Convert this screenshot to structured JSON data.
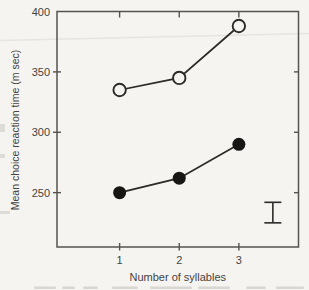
{
  "figure": {
    "paper_color": "#f5f4f1",
    "frame_color": "#55534f",
    "data_color": "#2c2a28",
    "marker_fill": "#171614",
    "text_color": "#454340"
  },
  "chart_data": {
    "type": "line",
    "title": "",
    "xlabel": "Number of syllables",
    "ylabel": "Mean choice reaction time (m sec)",
    "x": [
      1,
      2,
      3
    ],
    "xticks": [
      1,
      2,
      3
    ],
    "xtick_labels": [
      "1",
      "2",
      "3"
    ],
    "yticks": [
      250,
      300,
      350,
      400
    ],
    "ytick_labels": [
      "250",
      "300",
      "350",
      "400"
    ],
    "xlim": [
      -0.05,
      4.0
    ],
    "ylim": [
      205,
      400
    ],
    "grid": false,
    "legend": "none",
    "series": [
      {
        "name": "open-circles",
        "marker": "open-circle",
        "values": [
          335,
          345,
          388
        ]
      },
      {
        "name": "filled-circles",
        "marker": "filled-circle",
        "values": [
          250,
          262,
          290
        ]
      }
    ],
    "error_bar": {
      "x": 3.57,
      "low": 225,
      "high": 242
    }
  },
  "scan_artifacts": {
    "crease_line": {
      "x1": 0,
      "y1": 40.5,
      "x2": 309,
      "y2": 33.5,
      "color": "#e6e5e0"
    },
    "caption_remnants": [
      [
        34,
        22
      ],
      [
        62,
        13
      ],
      [
        83,
        15
      ],
      [
        112,
        26
      ],
      [
        150,
        42
      ],
      [
        198,
        32
      ],
      [
        246,
        20
      ],
      [
        276,
        28
      ]
    ],
    "remnant_color": "#c9c8c2",
    "edge_smudges": [
      [
        0,
        124,
        5,
        8
      ],
      [
        0,
        154,
        5,
        4
      ],
      [
        0,
        211,
        10,
        3
      ]
    ],
    "smudge_color": "#dcdbd6"
  }
}
